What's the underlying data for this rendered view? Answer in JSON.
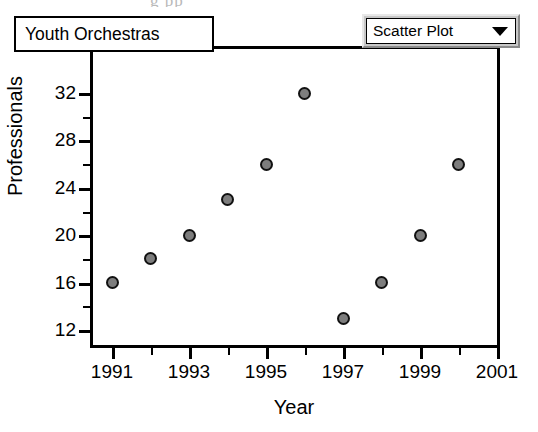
{
  "window": {
    "bleed_text": "g        pp"
  },
  "title_box": {
    "label": "Youth Orchestras"
  },
  "plot_type_selector": {
    "selected": "Scatter Plot",
    "arrow_icon": "chevron-down-icon",
    "options": [
      "Scatter Plot"
    ]
  },
  "chart_data": {
    "type": "scatter",
    "title": "Youth Orchestras",
    "xlabel": "Year",
    "ylabel": "Professionals",
    "x": [
      1991,
      1992,
      1993,
      1994,
      1995,
      1996,
      1997,
      1998,
      1999,
      2000
    ],
    "values": [
      16,
      18,
      20,
      23,
      26,
      32,
      13,
      16,
      20,
      26
    ],
    "points": [
      {
        "x": 1991,
        "y": 16
      },
      {
        "x": 1992,
        "y": 18
      },
      {
        "x": 1993,
        "y": 20
      },
      {
        "x": 1994,
        "y": 23
      },
      {
        "x": 1995,
        "y": 26
      },
      {
        "x": 1996,
        "y": 32
      },
      {
        "x": 1997,
        "y": 13
      },
      {
        "x": 1998,
        "y": 16
      },
      {
        "x": 1999,
        "y": 20
      },
      {
        "x": 2000,
        "y": 26
      }
    ],
    "xlim": [
      1991,
      2001
    ],
    "ylim": [
      12,
      33
    ],
    "xticks": [
      1991,
      1993,
      1995,
      1997,
      1999,
      2001
    ],
    "xticks_minor": [
      1992,
      1994,
      1996,
      1998,
      2000
    ],
    "yticks": [
      12,
      16,
      20,
      24,
      28,
      32
    ],
    "yticks_minor": [
      14,
      18,
      22,
      26,
      30
    ],
    "grid": false,
    "legend": "none",
    "marker_fill": "#7d7d7d",
    "marker_edge": "#111111"
  }
}
